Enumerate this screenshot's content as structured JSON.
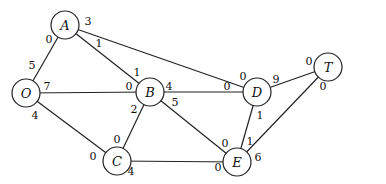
{
  "diagram": {
    "type": "flow-network",
    "nodes": [
      {
        "id": "A",
        "label": "A",
        "x": 65,
        "y": 25
      },
      {
        "id": "O",
        "label": "O",
        "x": 26,
        "y": 93
      },
      {
        "id": "B",
        "label": "B",
        "x": 150,
        "y": 92
      },
      {
        "id": "D",
        "label": "D",
        "x": 257,
        "y": 92
      },
      {
        "id": "T",
        "label": "T",
        "x": 328,
        "y": 67
      },
      {
        "id": "C",
        "label": "C",
        "x": 117,
        "y": 161
      },
      {
        "id": "E",
        "label": "E",
        "x": 237,
        "y": 162
      }
    ],
    "edges": [
      {
        "from": "O",
        "to": "A",
        "from_value": "5",
        "to_value": "0"
      },
      {
        "from": "A",
        "to": "B",
        "from_value": "1",
        "to_value": "1"
      },
      {
        "from": "A",
        "to": "D",
        "from_value": "3",
        "to_value": "0"
      },
      {
        "from": "O",
        "to": "B",
        "from_value": "7",
        "to_value": "0"
      },
      {
        "from": "O",
        "to": "C",
        "from_value": "4",
        "to_value": "0"
      },
      {
        "from": "B",
        "to": "D",
        "from_value": "4",
        "to_value": "0"
      },
      {
        "from": "B",
        "to": "C",
        "from_value": "2",
        "to_value": "0"
      },
      {
        "from": "B",
        "to": "E",
        "from_value": "5",
        "to_value": "0"
      },
      {
        "from": "C",
        "to": "E",
        "from_value": "4",
        "to_value": "0"
      },
      {
        "from": "D",
        "to": "T",
        "from_value": "9",
        "to_value": "0"
      },
      {
        "from": "D",
        "to": "E",
        "from_value": "1",
        "to_value": "1"
      },
      {
        "from": "E",
        "to": "T",
        "from_value": "6",
        "to_value": "0"
      }
    ],
    "capacity_labels": [
      {
        "text": "3",
        "x": 88,
        "y": 21
      },
      {
        "text": "0",
        "x": 49,
        "y": 39
      },
      {
        "text": "1",
        "x": 99,
        "y": 43
      },
      {
        "text": "5",
        "x": 32,
        "y": 65
      },
      {
        "text": "7",
        "x": 47,
        "y": 86
      },
      {
        "text": "1",
        "x": 137,
        "y": 72
      },
      {
        "text": "0",
        "x": 129,
        "y": 86
      },
      {
        "text": "4",
        "x": 169,
        "y": 86
      },
      {
        "text": "0",
        "x": 243,
        "y": 76
      },
      {
        "text": "0",
        "x": 227,
        "y": 86
      },
      {
        "text": "9",
        "x": 276,
        "y": 79
      },
      {
        "text": "0",
        "x": 309,
        "y": 61
      },
      {
        "text": "0",
        "x": 323,
        "y": 86
      },
      {
        "text": "4",
        "x": 35,
        "y": 115
      },
      {
        "text": "5",
        "x": 175,
        "y": 102
      },
      {
        "text": "2",
        "x": 134,
        "y": 109
      },
      {
        "text": "1",
        "x": 260,
        "y": 115
      },
      {
        "text": "0",
        "x": 117,
        "y": 139
      },
      {
        "text": "0",
        "x": 93,
        "y": 156
      },
      {
        "text": "4",
        "x": 131,
        "y": 171
      },
      {
        "text": "0",
        "x": 225,
        "y": 143
      },
      {
        "text": "1",
        "x": 250,
        "y": 141
      },
      {
        "text": "6",
        "x": 258,
        "y": 157
      },
      {
        "text": "0",
        "x": 218,
        "y": 167
      }
    ]
  }
}
